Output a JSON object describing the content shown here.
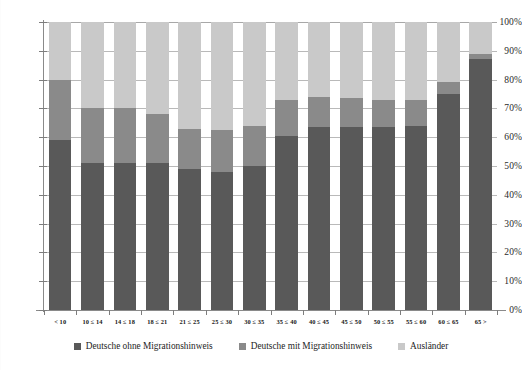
{
  "chart_data": {
    "type": "bar",
    "stacked": true,
    "normalized": true,
    "title": "",
    "xlabel": "",
    "ylabel": "",
    "ylim": [
      0,
      100
    ],
    "grid": true,
    "legend_position": "bottom",
    "categories": [
      "< 10",
      "10 ≤ 14",
      "14 ≤ 18",
      "18 ≤ 21",
      "21 ≤ 25",
      "25 ≤ 30",
      "30 ≤ 35",
      "35 ≤ 40",
      "40 ≤ 45",
      "45 ≤ 50",
      "50 ≤ 55",
      "55 ≤ 60",
      "60 ≤ 65",
      "65 >"
    ],
    "ytick_labels": [
      "100%",
      "90%",
      "80%",
      "70%",
      "60%",
      "50%",
      "40%",
      "30%",
      "20%",
      "10%",
      "0%"
    ],
    "ytick_values": [
      100,
      90,
      80,
      70,
      60,
      50,
      40,
      30,
      20,
      10,
      0
    ],
    "series": [
      {
        "name": "Deutsche ohne Migrationshinweis",
        "color": "#595959",
        "values": [
          59,
          51,
          51,
          51,
          49,
          48,
          50,
          60.5,
          63.5,
          63.5,
          63.5,
          64,
          75,
          87
        ]
      },
      {
        "name": "Deutsche mit Migrationshinweis",
        "color": "#8a8a8a",
        "values": [
          21,
          19,
          19,
          17,
          14,
          14.5,
          14,
          12.5,
          10.5,
          10,
          9.5,
          9,
          4,
          2
        ]
      },
      {
        "name": "Ausländer",
        "color": "#c9c9c9",
        "values": [
          20,
          30,
          30,
          32,
          37,
          37.5,
          36,
          27,
          26,
          26.5,
          27,
          27,
          21,
          11
        ]
      }
    ]
  },
  "legend": {
    "items": [
      {
        "label": "Deutsche ohne Migrationshinweis",
        "color": "#595959",
        "swatch_icon": "square-swatch-icon"
      },
      {
        "label": "Deutsche mit Migrationshinweis",
        "color": "#8a8a8a",
        "swatch_icon": "square-swatch-icon"
      },
      {
        "label": "Ausländer",
        "color": "#c9c9c9",
        "swatch_icon": "square-swatch-icon"
      }
    ]
  }
}
